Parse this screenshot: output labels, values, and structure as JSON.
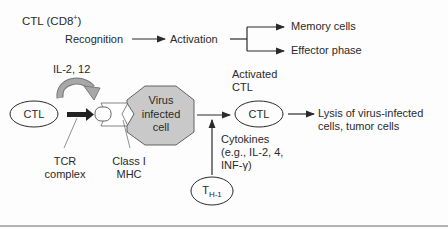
{
  "title": "CTL (CD8+)",
  "title_main": "CTL (CD8",
  "title_sup": "+",
  "title_close": ")",
  "flow": {
    "recognition": "Recognition",
    "activation": "Activation",
    "memory": "Memory cells",
    "effector": "Effector phase"
  },
  "cytokine_loop": "IL-2, 12",
  "nodes": {
    "ctl_left": "CTL",
    "virus_line1": "Virus",
    "virus_line2": "infected",
    "virus_line3": "cell",
    "activated_line1": "Activated",
    "activated_line2": "CTL",
    "ctl_right": "CTL",
    "th1_main": "T",
    "th1_sub": "H-1"
  },
  "labels": {
    "tcr_line1": "TCR",
    "tcr_line2": "complex",
    "mhc_line1": "Class I",
    "mhc_line2": "MHC",
    "lysis_line1": "Lysis of virus-infected",
    "lysis_line2": "cells, tumor cells",
    "cyto_line1": "Cytokines",
    "cyto_line2": "(e.g., IL-2, 4,",
    "cyto_line3": "INF-γ)"
  },
  "colors": {
    "virus_fill": "#c9c9c9",
    "arrow_gray": "#9a9a9a",
    "line": "#2a2a2a",
    "footer_rule": "#9a9a9a"
  }
}
